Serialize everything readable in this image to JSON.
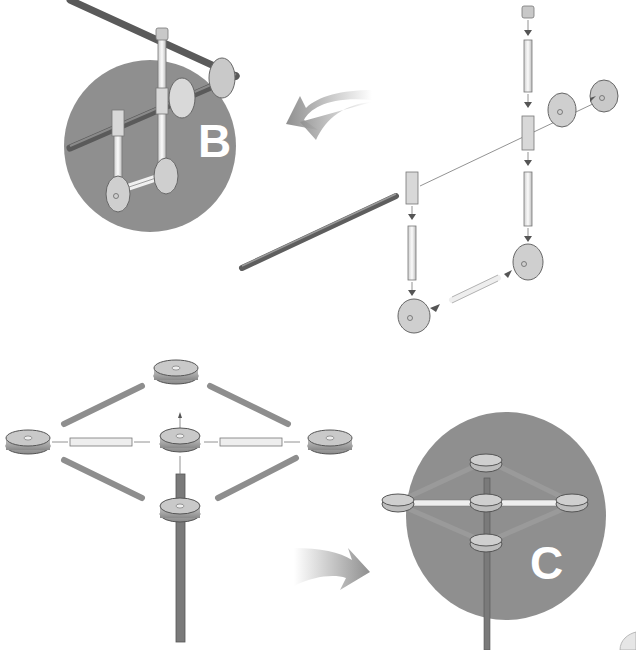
{
  "diagram": {
    "type": "assembly-instructions",
    "steps": [
      {
        "id": "B",
        "label": "B",
        "description": "Exploded view: cap, vertical tubes, T-connectors, long horizontal rod, wheel discs; assembled result shown in circle B",
        "parts": [
          "cap",
          "vertical-tube",
          "t-connector",
          "wheel-disc",
          "long-rod",
          "short-tube"
        ]
      },
      {
        "id": "C",
        "label": "C",
        "description": "Exploded view: five hub discs connected in a diamond by four diagonal rods and two horizontal tubes, central vertical pole; assembled result shown in circle C",
        "parts": [
          "hub-disc",
          "diagonal-rod",
          "horizontal-tube",
          "vertical-pole"
        ]
      }
    ],
    "colors": {
      "circle_fill": "#8f8f8f",
      "label_text": "#ffffff",
      "arrow_gray": "#9a9a9a",
      "part_light": "#e8e8e8",
      "part_mid": "#b5b5b5",
      "part_dark": "#6e6e6e",
      "background": "#ffffff"
    }
  }
}
